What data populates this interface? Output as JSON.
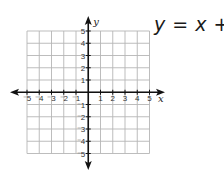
{
  "equation": {
    "lhs": "y",
    "eq": " = ",
    "x": "x",
    "rest": " + 4",
    "full": "y = x + 4"
  },
  "axes": {
    "x_label": "x",
    "y_label": "y",
    "x_ticks": [
      "-5",
      "-4",
      "-3",
      "-2",
      "-1",
      "1",
      "2",
      "3",
      "4",
      "5"
    ],
    "y_ticks": [
      "5",
      "4",
      "3",
      "2",
      "1",
      "-1",
      "-2",
      "-3",
      "-4",
      "-5"
    ]
  },
  "grid": {
    "xmin": -5,
    "xmax": 5,
    "ymin": -5,
    "ymax": 5,
    "step": 1,
    "line_color": "#b5b5b5",
    "axis_color": "#111111"
  }
}
